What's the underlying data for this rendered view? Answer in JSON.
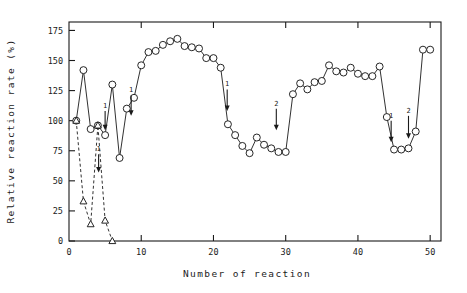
{
  "chart_data": {
    "type": "line",
    "title": "",
    "xlabel": "Number of reaction",
    "ylabel": "Relative reaction rate (%)",
    "xlim": [
      0,
      51.5
    ],
    "ylim": [
      0,
      182
    ],
    "xticks": [
      0,
      10,
      20,
      30,
      40,
      50
    ],
    "yticks": [
      0,
      25,
      50,
      75,
      100,
      125,
      150,
      175
    ],
    "xtick_labels": [
      "0",
      "10",
      "20",
      "30",
      "40",
      "50"
    ],
    "ytick_labels": [
      "0",
      "25",
      "50",
      "75",
      "100",
      "125",
      "150",
      "175"
    ],
    "grid": false,
    "legend": null,
    "series": [
      {
        "name": "immobilized-enzyme-with-regeneration",
        "marker": "open-circle",
        "linestyle": "solid",
        "x": [
          1,
          2,
          3,
          4,
          5,
          6,
          7,
          8,
          9,
          10,
          11,
          12,
          13,
          14,
          15,
          16,
          17,
          18,
          19,
          20,
          21,
          22,
          23,
          24,
          25,
          26,
          27,
          28,
          29,
          30,
          31,
          32,
          33,
          34,
          35,
          36,
          37,
          38,
          39,
          40,
          41,
          42,
          43,
          44,
          45,
          46,
          47,
          48,
          49,
          50
        ],
        "y": [
          100,
          142,
          93,
          96,
          88,
          130,
          69,
          110,
          119,
          146,
          157,
          158,
          163,
          166,
          168,
          162,
          161,
          160,
          152,
          152,
          144,
          97,
          88,
          79,
          73,
          86,
          80,
          77,
          74,
          74,
          122,
          131,
          126,
          132,
          133,
          146,
          141,
          140,
          144,
          139,
          137,
          137,
          145,
          103,
          76,
          76,
          77,
          91,
          159,
          159
        ]
      },
      {
        "name": "immobilized-enzyme-without-regeneration",
        "marker": "open-triangle",
        "linestyle": "dashed",
        "x": [
          1,
          2,
          3,
          4,
          5,
          6
        ],
        "y": [
          100,
          33,
          14,
          96,
          17,
          0
        ]
      }
    ],
    "annotations": [
      {
        "label": "1",
        "x": 5.0,
        "y": 108,
        "arrow_to_y": 92,
        "note": "regeneration-step-1"
      },
      {
        "label": "1",
        "x": 8.6,
        "y": 121,
        "arrow_to_y": 104,
        "note": "regeneration-step-1"
      },
      {
        "label": "1",
        "x": 4.1,
        "y": 72,
        "arrow_to_y": 57,
        "note": "regeneration-step-1"
      },
      {
        "label": "1",
        "x": 21.9,
        "y": 126,
        "arrow_to_y": 108,
        "note": "regeneration-step-1"
      },
      {
        "label": "2",
        "x": 28.7,
        "y": 110,
        "arrow_to_y": 92,
        "note": "regeneration-step-2"
      },
      {
        "label": "1",
        "x": 44.6,
        "y": 100,
        "arrow_to_y": 82,
        "note": "regeneration-step-1"
      },
      {
        "label": "2",
        "x": 47.0,
        "y": 104,
        "arrow_to_y": 85,
        "note": "regeneration-step-2"
      }
    ]
  }
}
